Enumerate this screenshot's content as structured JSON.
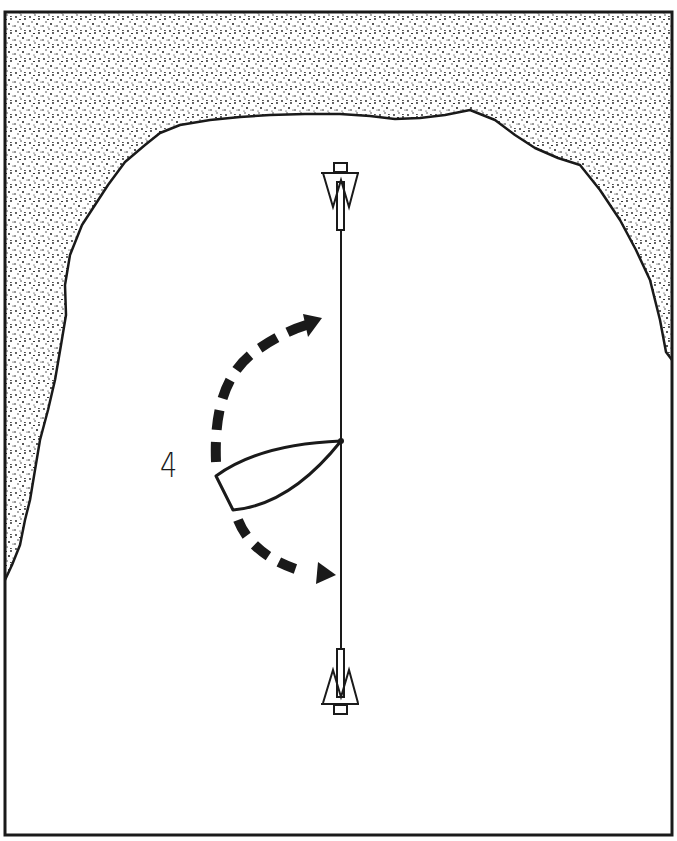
{
  "diagram": {
    "type": "mooring-diagram",
    "label": "4",
    "colors": {
      "ink": "#1a1a1a",
      "water": "#ffffff",
      "land_dots": "#1a1a1a"
    },
    "elements": {
      "shore": "stippled-land-around-bay",
      "anchor_top": "anchor-icon",
      "anchor_bottom": "anchor-icon",
      "mooring_line": "vertical-line-between-anchors",
      "boat": "boat-outline",
      "arrow_upper": "dashed-curved-arrow-swing-up",
      "arrow_lower": "dashed-curved-arrow-swing-down"
    }
  }
}
